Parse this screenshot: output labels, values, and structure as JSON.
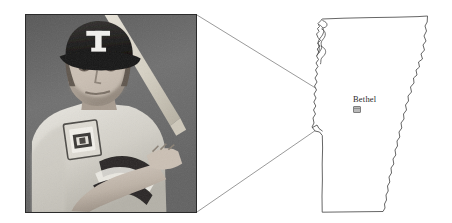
{
  "figure": {
    "caption_text": "",
    "background_color": "#ffffff"
  },
  "photo": {
    "alt_description": "Black and white photograph of a baseball player in batting stance",
    "subject": "baseball-player",
    "cap_logo_letter": "T",
    "team_hint": "Texas Rangers",
    "border_color": "#2b2b2b",
    "tone": "grayscale",
    "elements": [
      "baseball-cap",
      "bat",
      "jersey-shoulder-patch",
      "forearm",
      "batting-stance"
    ]
  },
  "map": {
    "region_name": "Vermont",
    "outline_color": "#4a4a4a",
    "fill_color": "#ffffff",
    "city": {
      "label": "Bethel",
      "marker_type": "town-marker",
      "marker_color": "#b9b9b9"
    }
  },
  "connector": {
    "line_color": "#8a8a8a",
    "description": "two leader lines from photo corners converging on the Bethel marker",
    "from_points": [
      "photo-top-right-corner",
      "photo-bottom-right-corner"
    ],
    "to_point": "bethel-marker"
  }
}
